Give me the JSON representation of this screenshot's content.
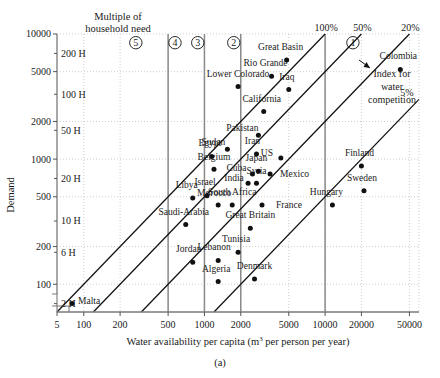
{
  "figure": {
    "caption": "(a)",
    "header_note_line1": "Multiple of",
    "header_note_line2": "household need",
    "annotation_line1": "Index for",
    "annotation_line2": "water",
    "annotation_line3": "competition"
  },
  "chart_data": {
    "type": "scatter",
    "title": "",
    "xlabel": "Water availability per capita (m3 per person per year)",
    "xlabel_base": "Water availability per capita (m",
    "xlabel_sup": "3",
    "xlabel_tail": " per person per year)",
    "ylabel": "Demand",
    "xscale": "log",
    "yscale": "log",
    "xlim": [
      60,
      60000
    ],
    "ylim": [
      60,
      10000
    ],
    "grid": true,
    "xticks": [
      5,
      100,
      200,
      500,
      1000,
      2000,
      5000,
      10000,
      20000,
      50000
    ],
    "xticklabels": [
      "5",
      "100",
      "200",
      "500",
      "1000",
      "2000",
      "5000",
      "10000",
      "20000",
      "50000"
    ],
    "yticks": [
      100,
      200,
      500,
      1000,
      2000,
      5000,
      10000
    ],
    "yticklabels": [
      "100",
      "200",
      "500",
      "1000",
      "2000",
      "5000",
      "10000"
    ],
    "secondary_y_labels": [
      "2 H",
      "6 H",
      "10 H",
      "20 H",
      "50 H",
      "100 H",
      "200 H"
    ],
    "secondary_y_values": [
      70,
      180,
      320,
      700,
      1700,
      3300,
      7000
    ],
    "competition_bands": [
      "5",
      "4",
      "3",
      "2",
      "1"
    ],
    "band_label_x": [
      270,
      570,
      880,
      1750,
      17000
    ],
    "band_boundaries_x": [
      500,
      1000,
      2000,
      10000
    ],
    "ratio_lines": [
      "100%",
      "50%",
      "20%",
      "5%"
    ],
    "ratio_line_labels_pct": [
      "100%",
      "50%",
      "20%",
      "5%"
    ],
    "points": [
      {
        "name": "Malta",
        "x": 80,
        "y": 70,
        "label_dx": 6,
        "label_dy": 0,
        "anchor": "start"
      },
      {
        "name": "Jordan",
        "x": 800,
        "y": 150,
        "label_dx": -4,
        "label_dy": -10,
        "anchor": "middle"
      },
      {
        "name": "Saudi-Arabia",
        "x": 700,
        "y": 300,
        "label_dx": -2,
        "label_dy": -10,
        "anchor": "middle"
      },
      {
        "name": "Libya",
        "x": 800,
        "y": 490,
        "label_dx": -6,
        "label_dy": -10,
        "anchor": "middle"
      },
      {
        "name": "Israel",
        "x": 1050,
        "y": 510,
        "label_dx": -2,
        "label_dy": -11,
        "anchor": "middle"
      },
      {
        "name": "Tunisia",
        "x": 1900,
        "y": 180,
        "label_dx": -2,
        "label_dy": -10,
        "anchor": "middle"
      },
      {
        "name": "Algeria",
        "x": 1300,
        "y": 105,
        "label_dx": -2,
        "label_dy": -10,
        "anchor": "middle"
      },
      {
        "name": "Lebanon",
        "x": 1300,
        "y": 155,
        "label_dx": -4,
        "label_dy": -10,
        "anchor": "middle"
      },
      {
        "name": "Morocco",
        "x": 1300,
        "y": 430,
        "label_dx": -4,
        "label_dy": -9,
        "anchor": "middle"
      },
      {
        "name": "South Africa",
        "x": 1700,
        "y": 430,
        "label_dx": 0,
        "label_dy": -10,
        "anchor": "middle"
      },
      {
        "name": "Belgium",
        "x": 1200,
        "y": 830,
        "label_dx": 0,
        "label_dy": -9,
        "anchor": "middle"
      },
      {
        "name": "Egypt",
        "x": 1150,
        "y": 1050,
        "label_dx": -2,
        "label_dy": -10,
        "anchor": "middle"
      },
      {
        "name": "Sudan",
        "x": 1550,
        "y": 1200,
        "label_dx": -14,
        "label_dy": -4,
        "anchor": "middle"
      },
      {
        "name": "Great Britain",
        "x": 2400,
        "y": 280,
        "label_dx": 0,
        "label_dy": -10,
        "anchor": "middle"
      },
      {
        "name": "Denmark",
        "x": 2600,
        "y": 110,
        "label_dx": 0,
        "label_dy": -10,
        "anchor": "middle"
      },
      {
        "name": "France",
        "x": 3000,
        "y": 430,
        "label_dx": 14,
        "label_dy": 3,
        "anchor": "start"
      },
      {
        "name": "India",
        "x": 2300,
        "y": 640,
        "label_dx": -14,
        "label_dy": -2,
        "anchor": "middle"
      },
      {
        "name": "Syria",
        "x": 2700,
        "y": 640,
        "label_dx": 0,
        "label_dy": -9,
        "anchor": "middle"
      },
      {
        "name": "Cuba",
        "x": 2500,
        "y": 760,
        "label_dx": -16,
        "label_dy": -3,
        "anchor": "middle"
      },
      {
        "name": "Japan",
        "x": 2800,
        "y": 800,
        "label_dx": -2,
        "label_dy": -10,
        "anchor": "middle"
      },
      {
        "name": "Mexico",
        "x": 3500,
        "y": 760,
        "label_dx": 10,
        "label_dy": 3,
        "anchor": "start"
      },
      {
        "name": "US",
        "x": 4300,
        "y": 1020,
        "label_dx": -14,
        "label_dy": -2,
        "anchor": "middle"
      },
      {
        "name": "Iran",
        "x": 2700,
        "y": 1100,
        "label_dx": -4,
        "label_dy": -10,
        "anchor": "middle"
      },
      {
        "name": "Pakistan",
        "x": 2800,
        "y": 1550,
        "label_dx": -16,
        "label_dy": -4,
        "anchor": "middle"
      },
      {
        "name": "California",
        "x": 3100,
        "y": 2400,
        "label_dx": -2,
        "label_dy": -10,
        "anchor": "middle"
      },
      {
        "name": "Lower Colorado",
        "x": 1900,
        "y": 3800,
        "label_dx": 0,
        "label_dy": -10,
        "anchor": "middle"
      },
      {
        "name": "Rio Grande",
        "x": 3600,
        "y": 4600,
        "label_dx": -6,
        "label_dy": -10,
        "anchor": "middle"
      },
      {
        "name": "Iraq",
        "x": 5000,
        "y": 3600,
        "label_dx": -2,
        "label_dy": -10,
        "anchor": "middle"
      },
      {
        "name": "Great Basin",
        "x": 4800,
        "y": 6200,
        "label_dx": -6,
        "label_dy": -10,
        "anchor": "middle"
      },
      {
        "name": "Hungary",
        "x": 11500,
        "y": 430,
        "label_dx": -6,
        "label_dy": -10,
        "anchor": "middle"
      },
      {
        "name": "Sweden",
        "x": 21000,
        "y": 560,
        "label_dx": -2,
        "label_dy": -10,
        "anchor": "middle"
      },
      {
        "name": "Finland",
        "x": 20000,
        "y": 880,
        "label_dx": -2,
        "label_dy": -10,
        "anchor": "middle"
      },
      {
        "name": "Colombia",
        "x": 42000,
        "y": 5200,
        "label_dx": -2,
        "label_dy": -11,
        "anchor": "middle"
      }
    ]
  }
}
